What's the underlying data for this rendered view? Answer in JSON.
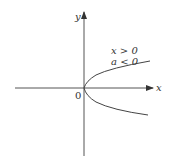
{
  "diagram": {
    "type": "coordinate-plot",
    "axes": {
      "x_label": "x",
      "y_label": "y",
      "origin_label": "0"
    },
    "curve": {
      "description": "parabola opening rightward, vertex at origin",
      "annotation_line1": "x > 0",
      "annotation_line2": "a < 0"
    },
    "colors": {
      "ink": "#333333",
      "background": "#ffffff"
    }
  }
}
